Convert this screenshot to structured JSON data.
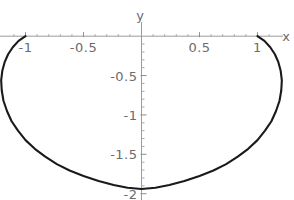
{
  "figure": {
    "background_color": "#ffffff",
    "axis_color": "#9a9a9a",
    "curve_color": "#1a1a1a",
    "label_color": "#6b6b6b",
    "x_axis_label": "x",
    "y_axis_label": "y"
  },
  "chart_data": {
    "type": "line",
    "title": "",
    "xlabel": "x",
    "ylabel": "y",
    "xlim": [
      -1.22,
      1.22
    ],
    "ylim": [
      -2.08,
      0.18
    ],
    "grid": false,
    "legend": null,
    "x_ticks": [
      {
        "value": -1,
        "label": "-1"
      },
      {
        "value": -0.5,
        "label": "-0.5"
      },
      {
        "value": 0.5,
        "label": "0.5"
      },
      {
        "value": 1,
        "label": "1"
      }
    ],
    "y_ticks": [
      {
        "value": -0.5,
        "label": "-0.5"
      },
      {
        "value": -1,
        "label": "-1"
      },
      {
        "value": -1.5,
        "label": "-1.5"
      },
      {
        "value": -2,
        "label": "-2"
      }
    ],
    "x_minor_ticks": [
      -1.1,
      -0.9,
      -0.8,
      -0.7,
      -0.6,
      -0.4,
      -0.3,
      -0.2,
      -0.1,
      0.1,
      0.2,
      0.3,
      0.4,
      0.6,
      0.7,
      0.8,
      0.9,
      1.1
    ],
    "y_minor_ticks": [
      -0.1,
      -0.2,
      -0.3,
      -0.4,
      -0.6,
      -0.7,
      -0.8,
      -0.9,
      -1.1,
      -1.2,
      -1.3,
      -1.4,
      -1.6,
      -1.7,
      -1.8,
      -1.9
    ],
    "series": [
      {
        "name": "curve",
        "closed": false,
        "description": "closed lower lobe from (-1,0) to (1,0) bulging to (0,-2)",
        "x": [
          -1.0,
          -1.06,
          -1.11,
          -1.15,
          -1.18,
          -1.2,
          -1.21,
          -1.205,
          -1.19,
          -1.16,
          -1.12,
          -1.065,
          -1.0,
          -0.92,
          -0.83,
          -0.73,
          -0.62,
          -0.5,
          -0.37,
          -0.24,
          -0.12,
          0.0,
          0.12,
          0.24,
          0.37,
          0.5,
          0.62,
          0.73,
          0.83,
          0.92,
          1.0,
          1.065,
          1.12,
          1.16,
          1.19,
          1.205,
          1.21,
          1.2,
          1.18,
          1.15,
          1.11,
          1.06,
          1.0
        ],
        "y": [
          0.0,
          -0.06,
          -0.14,
          -0.23,
          -0.33,
          -0.44,
          -0.56,
          -0.69,
          -0.82,
          -0.95,
          -1.08,
          -1.2,
          -1.32,
          -1.43,
          -1.53,
          -1.625,
          -1.705,
          -1.775,
          -1.84,
          -1.89,
          -1.925,
          -1.94,
          -1.925,
          -1.89,
          -1.84,
          -1.775,
          -1.705,
          -1.625,
          -1.53,
          -1.43,
          -1.32,
          -1.2,
          -1.08,
          -0.95,
          -0.82,
          -0.69,
          -0.56,
          -0.44,
          -0.33,
          -0.23,
          -0.14,
          -0.06,
          0.0
        ]
      }
    ]
  }
}
